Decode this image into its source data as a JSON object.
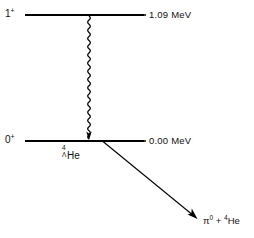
{
  "figure": {
    "kind": "nuclear-level-scheme",
    "background_color": "#ffffff",
    "line_color": "#000000",
    "width": 254,
    "height": 238
  },
  "levels": [
    {
      "id": "excited",
      "spin_parity": "1",
      "parity_sign": "+",
      "energy_label": "1.09 MeV",
      "y": 15,
      "x_start": 25,
      "x_end": 144
    },
    {
      "id": "ground",
      "spin_parity": "0",
      "parity_sign": "+",
      "energy_label": "0.00 MeV",
      "y": 141,
      "x_start": 25,
      "x_end": 144
    }
  ],
  "nuclide": {
    "mass_number": "4",
    "hyperon": "Λ",
    "symbol": "He"
  },
  "transitions": [
    {
      "id": "gamma-transition",
      "style": "wavy-arrow",
      "x": 89,
      "y_start": 16,
      "y_end": 139
    },
    {
      "id": "weak-decay",
      "style": "straight-arrow",
      "x_start": 103,
      "y_start": 141,
      "x_end": 197,
      "y_end": 219
    }
  ],
  "decay_products": {
    "pion": "π",
    "pion_charge": "0",
    "plus": "+",
    "helium_mass": "4",
    "helium_symbol": "He"
  }
}
